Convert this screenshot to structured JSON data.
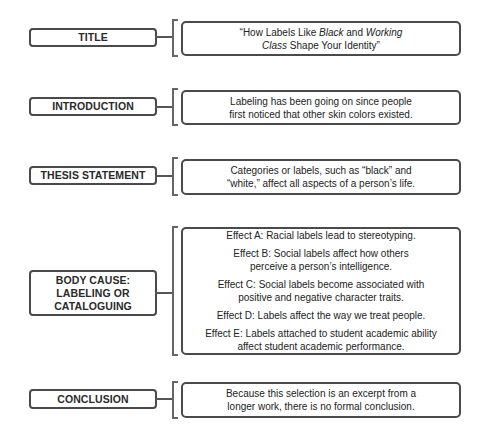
{
  "diagram": {
    "type": "essay-outline",
    "rows": [
      {
        "id": "title",
        "label": "TITLE",
        "content": [
          {
            "segments": [
              {
                "text": "“How Labels Like ",
                "italic": false
              },
              {
                "text": "Black",
                "italic": true
              },
              {
                "text": " and ",
                "italic": false
              },
              {
                "text": "Working",
                "italic": true
              }
            ]
          },
          {
            "segments": [
              {
                "text": "Class",
                "italic": true
              },
              {
                "text": " Shape Your Identity”",
                "italic": false
              }
            ]
          }
        ]
      },
      {
        "id": "introduction",
        "label": "INTRODUCTION",
        "content": [
          "Labeling has been going on since people first noticed that other skin colors existed."
        ]
      },
      {
        "id": "thesis",
        "label": "THESIS STATEMENT",
        "content": [
          "Categories or labels, such as “black” and “white,” affect all aspects of a person’s life."
        ]
      },
      {
        "id": "body",
        "label": "BODY CAUSE: LABELING OR CATALOGUING",
        "label_lines": [
          "BODY CAUSE:",
          "LABELING OR",
          "CATALOGUING"
        ],
        "content": [
          "Effect A: Racial labels lead to stereotyping.",
          "Effect B: Social labels affect how others perceive a person’s intelligence.",
          "Effect C: Social labels become associated with positive and negative character traits.",
          "Effect D: Labels affect the way we treat people.",
          "Effect E: Labels attached to student academic ability affect student academic performance."
        ]
      },
      {
        "id": "conclusion",
        "label": "CONCLUSION",
        "content": [
          "Because this selection is an excerpt from a longer work, there is no formal conclusion."
        ]
      }
    ],
    "colors": {
      "border": "#4a4a4a",
      "text": "#222222",
      "background": "#ffffff"
    }
  }
}
